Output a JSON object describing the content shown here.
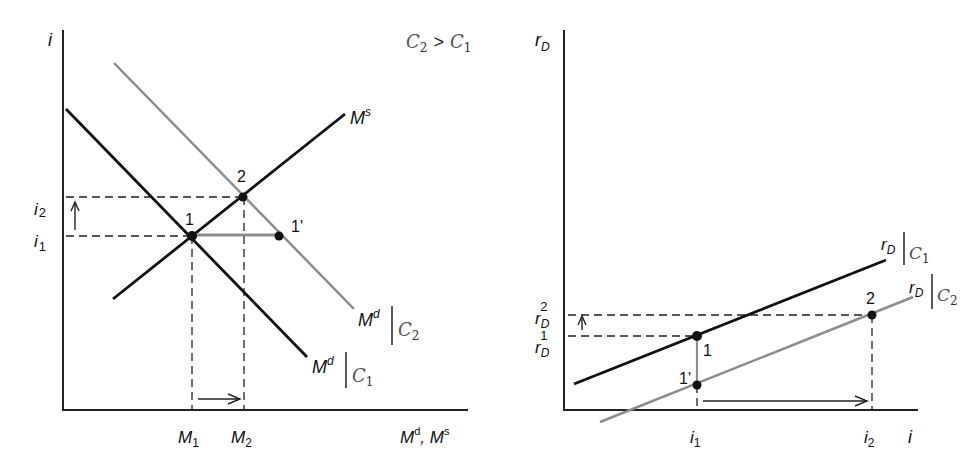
{
  "condition_label": {
    "c_left": "C",
    "sub_left": "2",
    "op": ">",
    "c_right": "C",
    "sub_right": "1"
  },
  "left_panel": {
    "y_axis_label": "i",
    "x_axis_label": "M",
    "x_axis_label_sup1": "d",
    "x_axis_sep": ", M",
    "x_axis_label_sup2": "s",
    "tick_labels_y": [
      {
        "base": "i",
        "sub": "2"
      },
      {
        "base": "i",
        "sub": "1"
      }
    ],
    "tick_labels_x": [
      {
        "base": "M",
        "sub": "1"
      },
      {
        "base": "M",
        "sub": "2"
      }
    ],
    "curves": {
      "supply": {
        "base": "M",
        "sup": "s"
      },
      "demand_c1": {
        "base": "M",
        "sup": "d",
        "cond": "C",
        "cond_sub": "1"
      },
      "demand_c2": {
        "base": "M",
        "sup": "d",
        "cond": "C",
        "cond_sub": "2"
      }
    },
    "points": [
      "1",
      "2",
      "1'"
    ]
  },
  "right_panel": {
    "y_axis_label": {
      "base": "r",
      "sub": "D"
    },
    "x_axis_label": "i",
    "tick_labels_y": [
      {
        "base": "r",
        "sub": "D",
        "sup": "2"
      },
      {
        "base": "r",
        "sub": "D",
        "sup": "1"
      }
    ],
    "tick_labels_x": [
      {
        "base": "i",
        "sub": "1"
      },
      {
        "base": "i",
        "sub": "2"
      }
    ],
    "curves": {
      "rd_c1": {
        "base": "r",
        "sub": "D",
        "cond": "C",
        "cond_sub": "1"
      },
      "rd_c2": {
        "base": "r",
        "sub": "D",
        "cond": "C",
        "cond_sub": "2"
      }
    },
    "points": [
      "1",
      "1'",
      "2"
    ]
  },
  "colors": {
    "black_curve": "#111111",
    "gray_curve": "#8c8c8c",
    "axis": "#222222"
  }
}
